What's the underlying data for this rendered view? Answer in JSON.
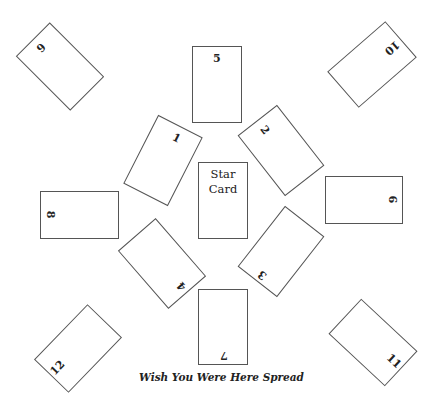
{
  "title": "Wish You Were Here Spread",
  "center_card": {
    "label_line1": "Star",
    "label_line2": "Card"
  },
  "cards": [
    {
      "id": "1",
      "label": "1"
    },
    {
      "id": "2",
      "label": "2"
    },
    {
      "id": "3",
      "label": "3"
    },
    {
      "id": "4",
      "label": "4"
    },
    {
      "id": "5",
      "label": "5"
    },
    {
      "id": "6",
      "label": "6"
    },
    {
      "id": "7",
      "label": "7"
    },
    {
      "id": "8",
      "label": "8"
    },
    {
      "id": "9",
      "label": "9"
    },
    {
      "id": "10",
      "label": "10"
    },
    {
      "id": "11",
      "label": "11"
    },
    {
      "id": "12",
      "label": "12"
    }
  ],
  "colors": {
    "card_border": "#555555",
    "background": "#ffffff",
    "text": "#222222"
  }
}
